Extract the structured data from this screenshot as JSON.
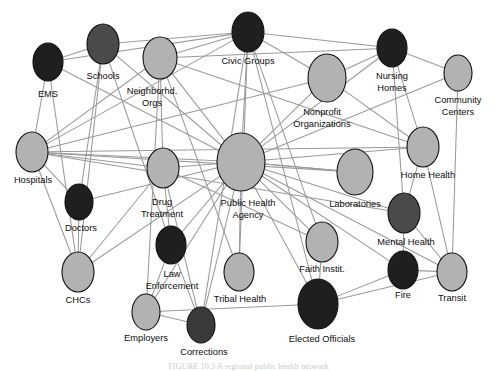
{
  "figure": {
    "caption": "FIGURE 10.3  A regional public health network",
    "background_color": "#ffffff",
    "edge_color": "#9a9a9a",
    "node_outline_color": "#111111",
    "palette": {
      "light": "#b0b0b0",
      "dark": "#3a3a3a",
      "darkest": "#1c1c1c"
    }
  },
  "chart_data": {
    "type": "network",
    "title": "",
    "node_count": 24,
    "edge_count": 66,
    "nodes": [
      {
        "id": "ems",
        "label": "EMS",
        "x": 48,
        "y": 62,
        "rx": 15,
        "ry": 19,
        "shade": "darkest",
        "color": "#1f1f1f",
        "label_x": 48,
        "label_y": 95
      },
      {
        "id": "schools",
        "label": "Schools",
        "x": 103,
        "y": 44,
        "rx": 16,
        "ry": 20,
        "shade": "dark",
        "color": "#4a4a4a",
        "label_x": 103,
        "label_y": 77
      },
      {
        "id": "neighborhood_orgs",
        "label": "Neighborhd.\nOrgs",
        "label_line1": "Neighborhd.",
        "label_line2": "Orgs",
        "x": 160,
        "y": 58,
        "rx": 17,
        "ry": 21,
        "shade": "light",
        "color": "#b2b2b2",
        "label_x": 152,
        "label_y": 92
      },
      {
        "id": "civic_groups",
        "label": "Civic Groups",
        "x": 248,
        "y": 32,
        "rx": 16,
        "ry": 20,
        "shade": "darkest",
        "color": "#1f1f1f",
        "label_x": 248,
        "label_y": 62
      },
      {
        "id": "nursing_homes",
        "label": "Nursing\nHomes",
        "label_line1": "Nursing",
        "label_line2": "Homes",
        "x": 392,
        "y": 48,
        "rx": 15,
        "ry": 19,
        "shade": "darkest",
        "color": "#1f1f1f",
        "label_x": 392,
        "label_y": 77
      },
      {
        "id": "nonprofit_orgs",
        "label": "Nonprofit\nOrganizations",
        "label_line1": "Nonprofit",
        "label_line2": "Organizations",
        "x": 327,
        "y": 78,
        "rx": 19,
        "ry": 24,
        "shade": "light",
        "color": "#b2b2b2",
        "label_x": 322,
        "label_y": 113
      },
      {
        "id": "community_centers",
        "label": "Community\nCenters",
        "label_line1": "Community",
        "label_line2": "Centers",
        "x": 458,
        "y": 73,
        "rx": 14,
        "ry": 18,
        "shade": "light",
        "color": "#b2b2b2",
        "label_x": 458,
        "label_y": 101
      },
      {
        "id": "hospitals",
        "label": "Hospitals",
        "x": 32,
        "y": 152,
        "rx": 16,
        "ry": 20,
        "shade": "light",
        "color": "#b2b2b2",
        "label_x": 33,
        "label_y": 181
      },
      {
        "id": "home_health",
        "label": "Home Health",
        "x": 423,
        "y": 147,
        "rx": 16,
        "ry": 20,
        "shade": "light",
        "color": "#b2b2b2",
        "label_x": 428,
        "label_y": 176
      },
      {
        "id": "public_health_agency",
        "label": "Public Health\nAgency",
        "label_line1": "Public Health",
        "label_line2": "Agency",
        "x": 241,
        "y": 162,
        "rx": 24,
        "ry": 29,
        "shade": "light",
        "color": "#b2b2b2",
        "label_x": 248,
        "label_y": 204
      },
      {
        "id": "drug_treatment",
        "label": "Drug\nTreatment",
        "label_line1": "Drug",
        "label_line2": "Treatment",
        "x": 163,
        "y": 168,
        "rx": 16,
        "ry": 20,
        "shade": "light",
        "color": "#b2b2b2",
        "label_x": 162,
        "label_y": 203
      },
      {
        "id": "laboratories",
        "label": "Laboratories",
        "x": 355,
        "y": 172,
        "rx": 18,
        "ry": 23,
        "shade": "light",
        "color": "#b2b2b2",
        "label_x": 355,
        "label_y": 205
      },
      {
        "id": "doctors",
        "label": "Doctors",
        "x": 79,
        "y": 202,
        "rx": 14,
        "ry": 18,
        "shade": "darkest",
        "color": "#1f1f1f",
        "label_x": 81,
        "label_y": 229
      },
      {
        "id": "mental_health",
        "label": "Mental Health",
        "x": 404,
        "y": 213,
        "rx": 16,
        "ry": 20,
        "shade": "dark",
        "color": "#4a4a4a",
        "label_x": 406,
        "label_y": 243
      },
      {
        "id": "faith_instit",
        "label": "Faith Instit.",
        "x": 322,
        "y": 242,
        "rx": 16,
        "ry": 20,
        "shade": "light",
        "color": "#b2b2b2",
        "label_x": 322,
        "label_y": 270
      },
      {
        "id": "chcs",
        "label": "CHCs",
        "x": 78,
        "y": 272,
        "rx": 16,
        "ry": 20,
        "shade": "light",
        "color": "#b2b2b2",
        "label_x": 78,
        "label_y": 301
      },
      {
        "id": "law_enforcement",
        "label": "Law\nEnforcement",
        "label_line1": "Law",
        "label_line2": "Enforcement",
        "x": 171,
        "y": 245,
        "rx": 15,
        "ry": 19,
        "shade": "darkest",
        "color": "#1f1f1f",
        "label_x": 172,
        "label_y": 275
      },
      {
        "id": "fire",
        "label": "Fire",
        "x": 403,
        "y": 270,
        "rx": 15,
        "ry": 19,
        "shade": "darkest",
        "color": "#1f1f1f",
        "label_x": 403,
        "label_y": 296
      },
      {
        "id": "transit",
        "label": "Transit",
        "x": 452,
        "y": 272,
        "rx": 15,
        "ry": 19,
        "shade": "light",
        "color": "#b2b2b2",
        "label_x": 452,
        "label_y": 299
      },
      {
        "id": "tribal_health",
        "label": "Tribal Health",
        "x": 239,
        "y": 272,
        "rx": 15,
        "ry": 19,
        "shade": "light",
        "color": "#b2b2b2",
        "label_x": 240,
        "label_y": 300
      },
      {
        "id": "employers",
        "label": "Employers",
        "x": 146,
        "y": 312,
        "rx": 14,
        "ry": 18,
        "shade": "light",
        "color": "#b2b2b2",
        "label_x": 146,
        "label_y": 339
      },
      {
        "id": "corrections",
        "label": "Corrections",
        "x": 201,
        "y": 325,
        "rx": 14,
        "ry": 18,
        "shade": "dark",
        "color": "#3a3a3a",
        "label_x": 204,
        "label_y": 353
      },
      {
        "id": "elected_officials",
        "label": "Elected Officials",
        "x": 318,
        "y": 304,
        "rx": 20,
        "ry": 25,
        "shade": "darkest",
        "color": "#1f1f1f",
        "label_x": 322,
        "label_y": 340
      }
    ],
    "edges": [
      {
        "source": "ems",
        "target": "schools"
      },
      {
        "source": "ems",
        "target": "civic_groups"
      },
      {
        "source": "ems",
        "target": "hospitals"
      },
      {
        "source": "ems",
        "target": "chcs"
      },
      {
        "source": "ems",
        "target": "public_health_agency"
      },
      {
        "source": "schools",
        "target": "civic_groups"
      },
      {
        "source": "schools",
        "target": "doctors"
      },
      {
        "source": "schools",
        "target": "chcs"
      },
      {
        "source": "schools",
        "target": "public_health_agency"
      },
      {
        "source": "schools",
        "target": "law_enforcement"
      },
      {
        "source": "neighborhood_orgs",
        "target": "hospitals"
      },
      {
        "source": "neighborhood_orgs",
        "target": "civic_groups"
      },
      {
        "source": "neighborhood_orgs",
        "target": "public_health_agency"
      },
      {
        "source": "neighborhood_orgs",
        "target": "drug_treatment"
      },
      {
        "source": "neighborhood_orgs",
        "target": "nursing_homes"
      },
      {
        "source": "neighborhood_orgs",
        "target": "home_health"
      },
      {
        "source": "neighborhood_orgs",
        "target": "employers"
      },
      {
        "source": "neighborhood_orgs",
        "target": "tribal_health"
      },
      {
        "source": "civic_groups",
        "target": "nonprofit_orgs"
      },
      {
        "source": "civic_groups",
        "target": "nursing_homes"
      },
      {
        "source": "civic_groups",
        "target": "public_health_agency"
      },
      {
        "source": "civic_groups",
        "target": "hospitals"
      },
      {
        "source": "civic_groups",
        "target": "faith_instit"
      },
      {
        "source": "civic_groups",
        "target": "elected_officials"
      },
      {
        "source": "civic_groups",
        "target": "tribal_health"
      },
      {
        "source": "civic_groups",
        "target": "corrections"
      },
      {
        "source": "nonprofit_orgs",
        "target": "public_health_agency"
      },
      {
        "source": "nonprofit_orgs",
        "target": "nursing_homes"
      },
      {
        "source": "nonprofit_orgs",
        "target": "hospitals"
      },
      {
        "source": "nonprofit_orgs",
        "target": "home_health"
      },
      {
        "source": "nursing_homes",
        "target": "community_centers"
      },
      {
        "source": "nursing_homes",
        "target": "home_health"
      },
      {
        "source": "nursing_homes",
        "target": "mental_health"
      },
      {
        "source": "nursing_homes",
        "target": "public_health_agency"
      },
      {
        "source": "community_centers",
        "target": "transit"
      },
      {
        "source": "community_centers",
        "target": "public_health_agency"
      },
      {
        "source": "hospitals",
        "target": "doctors"
      },
      {
        "source": "hospitals",
        "target": "chcs"
      },
      {
        "source": "hospitals",
        "target": "public_health_agency"
      },
      {
        "source": "hospitals",
        "target": "drug_treatment"
      },
      {
        "source": "hospitals",
        "target": "home_health"
      },
      {
        "source": "hospitals",
        "target": "laboratories"
      },
      {
        "source": "hospitals",
        "target": "mental_health"
      },
      {
        "source": "home_health",
        "target": "mental_health"
      },
      {
        "source": "home_health",
        "target": "public_health_agency"
      },
      {
        "source": "home_health",
        "target": "transit"
      },
      {
        "source": "public_health_agency",
        "target": "drug_treatment"
      },
      {
        "source": "public_health_agency",
        "target": "laboratories"
      },
      {
        "source": "public_health_agency",
        "target": "doctors"
      },
      {
        "source": "public_health_agency",
        "target": "mental_health"
      },
      {
        "source": "public_health_agency",
        "target": "faith_instit"
      },
      {
        "source": "public_health_agency",
        "target": "chcs"
      },
      {
        "source": "public_health_agency",
        "target": "law_enforcement"
      },
      {
        "source": "public_health_agency",
        "target": "fire"
      },
      {
        "source": "public_health_agency",
        "target": "transit"
      },
      {
        "source": "public_health_agency",
        "target": "tribal_health"
      },
      {
        "source": "public_health_agency",
        "target": "employers"
      },
      {
        "source": "public_health_agency",
        "target": "corrections"
      },
      {
        "source": "public_health_agency",
        "target": "elected_officials"
      },
      {
        "source": "drug_treatment",
        "target": "law_enforcement"
      },
      {
        "source": "drug_treatment",
        "target": "corrections"
      },
      {
        "source": "drug_treatment",
        "target": "chcs"
      },
      {
        "source": "drug_treatment",
        "target": "faith_instit"
      },
      {
        "source": "doctors",
        "target": "chcs"
      },
      {
        "source": "laboratories",
        "target": "public_health_agency"
      },
      {
        "source": "mental_health",
        "target": "fire"
      },
      {
        "source": "mental_health",
        "target": "transit"
      },
      {
        "source": "faith_instit",
        "target": "elected_officials"
      },
      {
        "source": "law_enforcement",
        "target": "employers"
      },
      {
        "source": "law_enforcement",
        "target": "corrections"
      },
      {
        "source": "fire",
        "target": "transit"
      },
      {
        "source": "elected_officials",
        "target": "fire"
      },
      {
        "source": "elected_officials",
        "target": "transit"
      },
      {
        "source": "elected_officials",
        "target": "employers"
      },
      {
        "source": "employers",
        "target": "corrections"
      }
    ]
  }
}
